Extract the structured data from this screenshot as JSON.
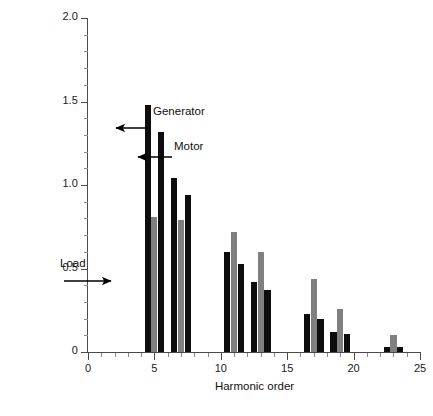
{
  "chart_data": {
    "type": "bar",
    "title": "",
    "subtitle": "",
    "xlabel": "Harmonic order",
    "ylabel": "Current spectrum (%)",
    "xlim": [
      0,
      25
    ],
    "ylim": [
      0,
      2.0
    ],
    "grid": false,
    "legend_position": "inline-annotations",
    "categories": [
      5,
      7,
      11,
      13,
      17,
      19,
      23
    ],
    "xticks": [
      "0",
      "5",
      "10",
      "15",
      "20",
      "25"
    ],
    "xtick_values": [
      0,
      5,
      10,
      15,
      20,
      25
    ],
    "yticks": [
      "0",
      "0.5",
      "1.0",
      "1.5",
      "2.0"
    ],
    "ytick_values": [
      0,
      0.5,
      1.0,
      1.5,
      2.0
    ],
    "series": [
      {
        "name": "Generator",
        "color": "#0d0d0d",
        "values": [
          1.48,
          1.04,
          0.6,
          0.42,
          0.23,
          0.12,
          0.03
        ]
      },
      {
        "name": "Load",
        "color": "#808080",
        "values": [
          0.81,
          0.79,
          0.72,
          0.6,
          0.44,
          0.26,
          0.1
        ]
      },
      {
        "name": "Motor",
        "color": "#0d0d0d",
        "values": [
          1.32,
          0.94,
          0.53,
          0.37,
          0.2,
          0.11,
          0.03
        ]
      }
    ],
    "annotations": [
      {
        "text": "Generator",
        "points_to_series": "Generator",
        "points_to_category": 5
      },
      {
        "text": "Motor",
        "points_to_series": "Motor",
        "points_to_category": 5
      },
      {
        "text": "Load",
        "points_to_series": "Load",
        "points_to_category": 5
      }
    ]
  },
  "axes": {
    "y_title": "Current spectrum (%)",
    "x_title": "Harmonic order",
    "y_labels": [
      "2.0",
      "1.5",
      "1.0",
      "0.5",
      "0"
    ],
    "x_labels": [
      "0",
      "5",
      "10",
      "15",
      "20",
      "25"
    ]
  },
  "annotations": {
    "generator": "Generator",
    "motor": "Motor",
    "load": "Load"
  },
  "colors": {
    "generator": "#0d0d0d",
    "load": "#808080",
    "motor": "#0d0d0d",
    "axis": "#4a4a4a",
    "background": "#ffffff"
  }
}
